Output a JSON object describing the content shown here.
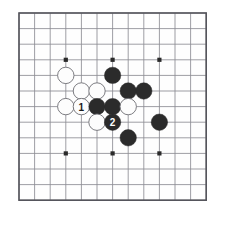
{
  "app": {
    "title": "Go Board Diagram",
    "background_color": "#ffffff"
  },
  "board": {
    "name": "go-board",
    "description": "Cropped go board section showing a local joseki fight",
    "columns": 12,
    "rows": 12,
    "cell_size": 15.6,
    "origin_x": 19,
    "origin_y": 13,
    "line_color": "#8d8d93",
    "border_color": "#55555c",
    "board_color": "#fefefe",
    "star_point_color": "#2a2a2a",
    "star_point_radius": 2.1,
    "star_points": [
      {
        "col": 3,
        "row": 3
      },
      {
        "col": 6,
        "row": 3
      },
      {
        "col": 9,
        "row": 3
      },
      {
        "col": 3,
        "row": 9
      },
      {
        "col": 6,
        "row": 9
      },
      {
        "col": 9,
        "row": 9
      }
    ]
  },
  "stones": {
    "radius": 8.2,
    "black_color": "#2b2b2b",
    "white_color": "#fdfdfd",
    "white_edge_color": "#6e6e74",
    "black_label_color": "#ffffff",
    "white_label_color": "#1a1a1a",
    "items": [
      {
        "col": 3,
        "row": 4,
        "color": "white",
        "label": ""
      },
      {
        "col": 6,
        "row": 4,
        "color": "black",
        "label": ""
      },
      {
        "col": 4,
        "row": 5,
        "color": "white",
        "label": ""
      },
      {
        "col": 5,
        "row": 5,
        "color": "white",
        "label": ""
      },
      {
        "col": 7,
        "row": 5,
        "color": "black",
        "label": ""
      },
      {
        "col": 8,
        "row": 5,
        "color": "black",
        "label": ""
      },
      {
        "col": 3,
        "row": 6,
        "color": "white",
        "label": ""
      },
      {
        "col": 4,
        "row": 6,
        "color": "white",
        "label": "1"
      },
      {
        "col": 5,
        "row": 6,
        "color": "black",
        "label": ""
      },
      {
        "col": 6,
        "row": 6,
        "color": "black",
        "label": ""
      },
      {
        "col": 7,
        "row": 6,
        "color": "white",
        "label": ""
      },
      {
        "col": 5,
        "row": 7,
        "color": "white",
        "label": ""
      },
      {
        "col": 6,
        "row": 7,
        "color": "black",
        "label": "2"
      },
      {
        "col": 9,
        "row": 7,
        "color": "black",
        "label": ""
      },
      {
        "col": 7,
        "row": 8,
        "color": "black",
        "label": ""
      }
    ]
  },
  "move_markers": [
    {
      "number": "1",
      "color": "white",
      "col": 4,
      "row": 6
    },
    {
      "number": "2",
      "color": "black",
      "col": 6,
      "row": 7
    }
  ]
}
